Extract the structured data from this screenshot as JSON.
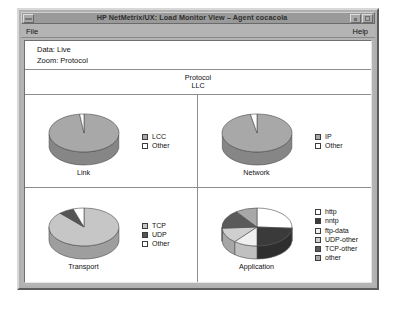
{
  "window": {
    "title": "HP NetMetrix/UX: Load Monitor View – Agent cocacola",
    "system_menu_icon": "window-menu-icon",
    "minimize_icon": "minimize-icon",
    "maximize_icon": "maximize-icon"
  },
  "menubar": {
    "file": "File",
    "help": "Help"
  },
  "status": {
    "data": "Data: Live",
    "zoom": "Zoom: Protocol"
  },
  "chart_header": {
    "line1": "Protocol",
    "line2": "LLC"
  },
  "colors": {
    "white": "#ffffff",
    "light_gray": "#d2d2d2",
    "mid_gray": "#a8a8a8",
    "gray": "#9c9c9c",
    "dark_gray": "#555555",
    "darker": "#3a3a3a",
    "black": "#2a2a2a",
    "outline": "#3c3c3c",
    "frame": "#b4b4b4",
    "titlebar": "#9a9a9a"
  },
  "chart_data": [
    {
      "type": "pie",
      "title": "Link",
      "labels": [
        "LCC",
        "Other"
      ],
      "values": [
        98,
        2
      ],
      "slice_colors": [
        "#a8a8a8",
        "#ffffff"
      ],
      "legend_position": "right",
      "three_d": true
    },
    {
      "type": "pie",
      "title": "Network",
      "labels": [
        "IP",
        "Other"
      ],
      "values": [
        97,
        3
      ],
      "slice_colors": [
        "#a8a8a8",
        "#ffffff"
      ],
      "legend_position": "right",
      "three_d": true
    },
    {
      "type": "pie",
      "title": "Transport",
      "labels": [
        "TCP",
        "UDP",
        "Other"
      ],
      "values": [
        88,
        7,
        5
      ],
      "slice_colors": [
        "#c6c6c6",
        "#555555",
        "#ffffff"
      ],
      "legend_position": "right",
      "three_d": true
    },
    {
      "type": "pie",
      "title": "Application",
      "labels": [
        "http",
        "nntp",
        "ftp-data",
        "UDP-other",
        "TCP-other",
        "other"
      ],
      "values": [
        26,
        24,
        11,
        13,
        16,
        10
      ],
      "slice_colors": [
        "#ffffff",
        "#3a3a3a",
        "#f0f0f0",
        "#cfcfcf",
        "#5a5a5a",
        "#a8a8a8"
      ],
      "legend_position": "right",
      "three_d": true
    }
  ]
}
